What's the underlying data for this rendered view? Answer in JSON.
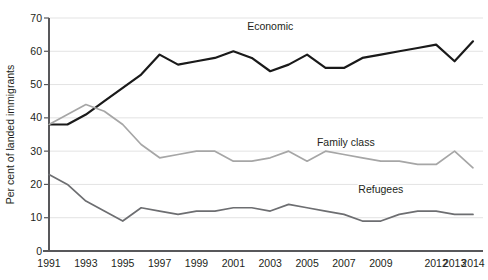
{
  "chart_data": {
    "type": "line",
    "title": "",
    "xlabel": "",
    "ylabel": "Per cent of landed immigrants",
    "ylim": [
      0,
      70
    ],
    "ytick_values": [
      0,
      10,
      20,
      30,
      40,
      50,
      60,
      70
    ],
    "ytick_labels": [
      "0",
      "10",
      "20",
      "30",
      "40",
      "50",
      "60",
      "70"
    ],
    "grid": true,
    "legend_position": "inline-annotations",
    "categories": [
      "1991",
      "1992",
      "1993",
      "1994",
      "1995",
      "1996",
      "1997",
      "1998",
      "1999",
      "2000",
      "2001",
      "2002",
      "2003",
      "2004",
      "2005",
      "2006",
      "2007",
      "2008",
      "2009",
      "2010",
      "2011",
      "2012",
      "2013",
      "2014"
    ],
    "xtick_labels": [
      "1991",
      "1993",
      "1995",
      "1997",
      "1999",
      "2001",
      "2003",
      "2005",
      "2007",
      "2009",
      "2012",
      "2013",
      "2014"
    ],
    "series": [
      {
        "name": "Economic",
        "color": "#1a1a1a",
        "width": 2.2,
        "label_x_index": 12.0,
        "label_y_value": 66.5,
        "values": [
          38,
          38,
          41,
          45,
          49,
          53,
          59,
          56,
          57,
          58,
          60,
          58,
          54,
          56,
          59,
          55,
          55,
          58,
          59,
          60,
          61,
          62,
          57,
          63
        ]
      },
      {
        "name": "Family class",
        "color": "#a6a6a6",
        "width": 1.7,
        "label_x_index": 16.1,
        "label_y_value": 31.5,
        "values": [
          38,
          41,
          44,
          42,
          38,
          32,
          28,
          29,
          30,
          30,
          27,
          27,
          28,
          30,
          27,
          30,
          29,
          28,
          27,
          27,
          26,
          26,
          30,
          25
        ]
      },
      {
        "name": "Refugees",
        "color": "#6d6e71",
        "width": 1.7,
        "label_x_index": 18.0,
        "label_y_value": 17.5,
        "values": [
          23,
          20,
          15,
          12,
          9,
          13,
          12,
          11,
          12,
          12,
          13,
          13,
          12,
          14,
          13,
          12,
          11,
          9,
          9,
          11,
          12,
          12,
          11,
          11
        ]
      }
    ]
  },
  "annotations": {
    "economic": "Economic",
    "family_class": "Family class",
    "refugees": "Refugees"
  }
}
